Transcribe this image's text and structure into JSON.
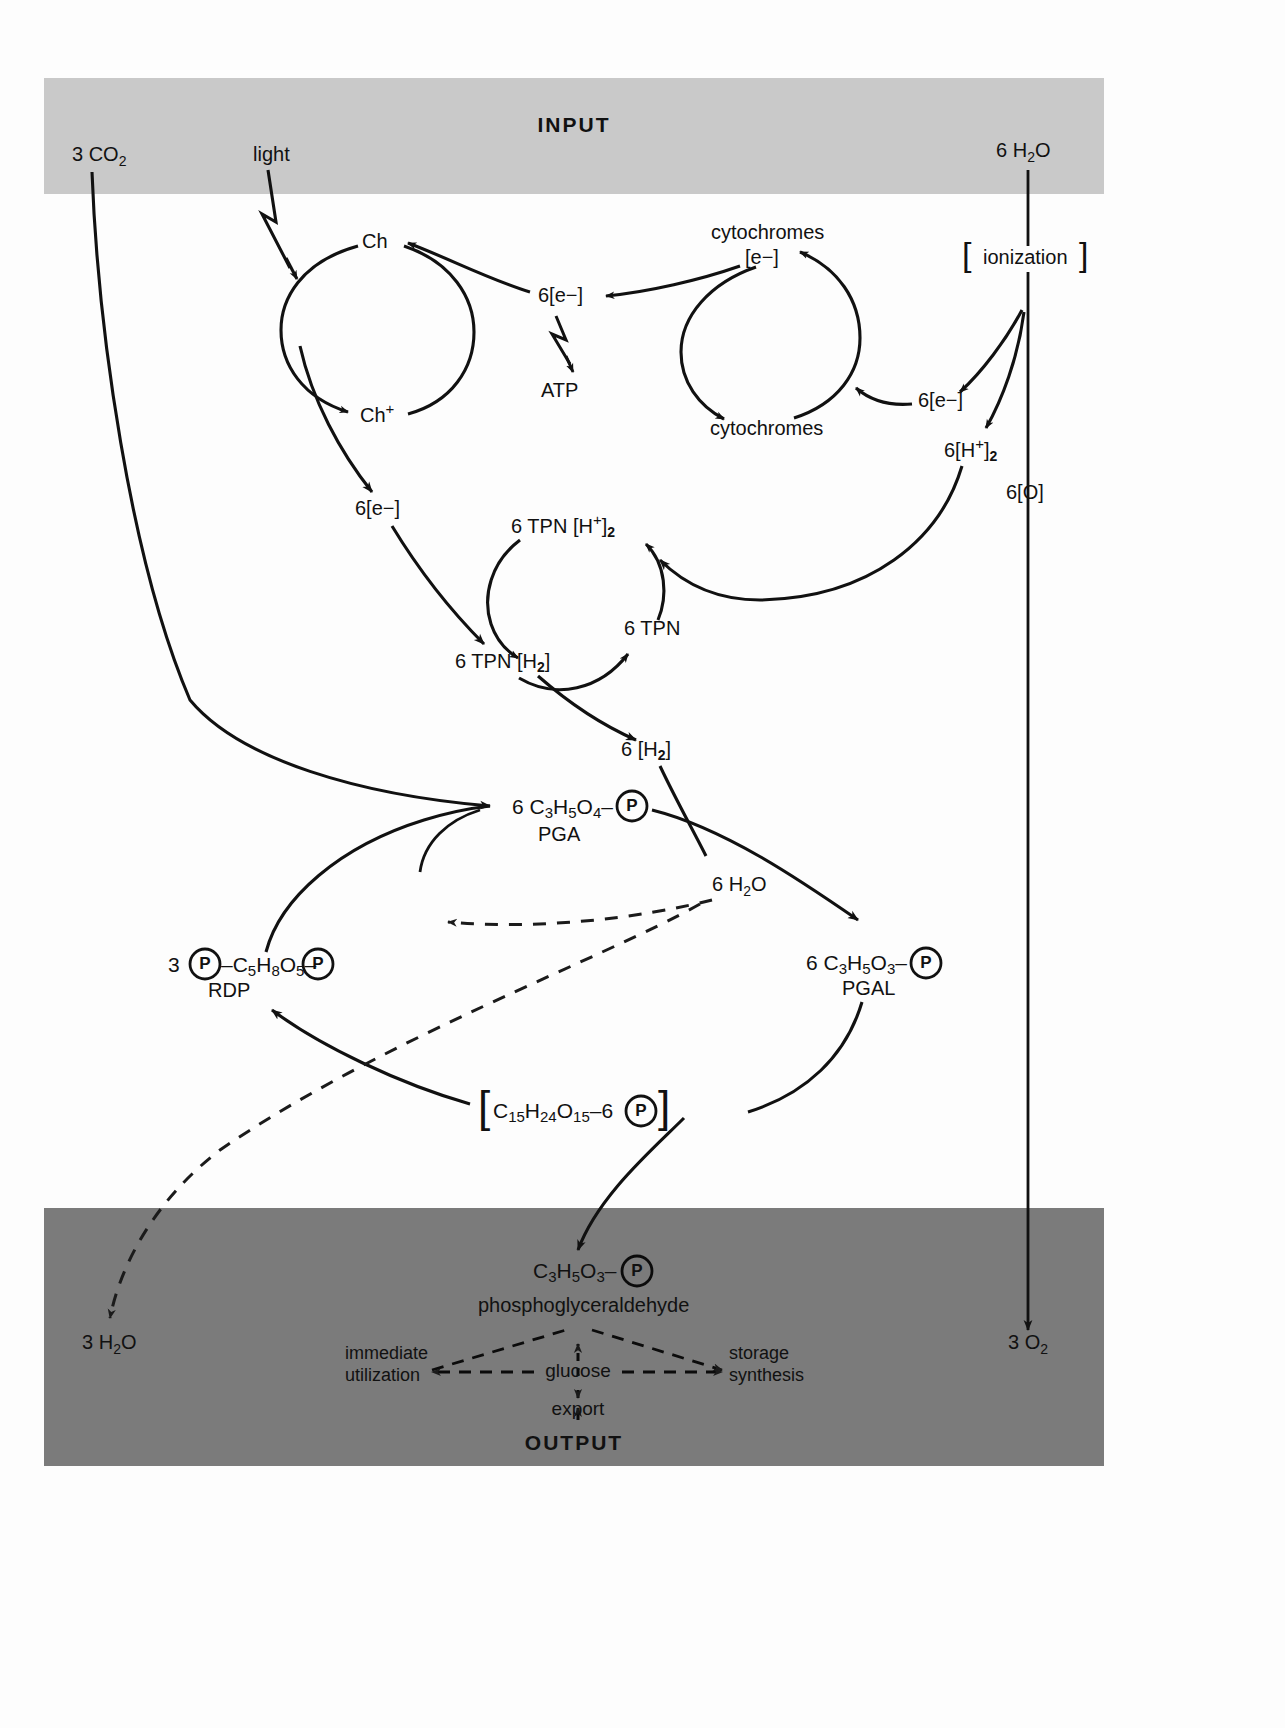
{
  "figure": {
    "input_band": {
      "title": "INPUT",
      "color": "#c9c9c9"
    },
    "output_band": {
      "title": "OUTPUT",
      "color": "#7b7b7b"
    },
    "page_background": "#fdfdfd",
    "ink": "#111111"
  },
  "inputs": {
    "co2": "3 CO",
    "co2_sub": "2",
    "light": "light",
    "water": "6 H",
    "water_sub": "2",
    "water_tail": "O"
  },
  "light_reactions": {
    "chlorophyll_reduced": "Ch",
    "chlorophyll_oxidized": "Ch",
    "chlorophyll_oxidized_sup": "+",
    "electrons_atp": "6[e−]",
    "atp": "ATP",
    "cytochromes_reduced": "cytochromes",
    "cytochromes_reduced_line2": "[e−]",
    "cytochromes_oxidized": "cytochromes",
    "electrons_from_water": "6[e−]",
    "electrons_to_tpn": "6[e−]",
    "ionization": "ionization",
    "bracket_open": "[",
    "bracket_close": "]",
    "protons": "6[H",
    "protons_sup": "+",
    "protons_mid": "]",
    "protons_sub": "2",
    "oxygen_atoms": "6[O]"
  },
  "tpn_cycle": {
    "tpn_protons": "6  TPN [H",
    "tpn_protons_sup": "+",
    "tpn_protons_mid": "]",
    "tpn_protons_sub": "2",
    "tpn": "6  TPN",
    "tpn_h2": "6  TPN [H",
    "tpn_h2_sub": "2",
    "tpn_h2_tail": "]",
    "hydrogen": "6 [H",
    "hydrogen_sub": "2",
    "hydrogen_tail": "]"
  },
  "carbon_cycle": {
    "pga_formula_a": "6 C",
    "pga_formula_a_sub": "3",
    "pga_formula_b": "H",
    "pga_formula_b_sub": "5",
    "pga_formula_c": "O",
    "pga_formula_c_sub": "4",
    "pga_dash": "–",
    "pga_name": "PGA",
    "water_byproduct": "6 H",
    "water_byproduct_sub": "2",
    "water_byproduct_tail": "O",
    "rdp_count": "3",
    "rdp_dash_left": "–",
    "rdp_formula_a": "C",
    "rdp_formula_a_sub": "5",
    "rdp_formula_b": "H",
    "rdp_formula_b_sub": "8",
    "rdp_formula_c": "O",
    "rdp_formula_c_sub": "5",
    "rdp_dash_right": "–",
    "rdp_name": "RDP",
    "pgal_formula_a": "6 C",
    "pgal_formula_a_sub": "3",
    "pgal_formula_b": "H",
    "pgal_formula_b_sub": "5",
    "pgal_formula_c": "O",
    "pgal_formula_c_sub": "3",
    "pgal_dash": "–",
    "pgal_name": "PGAL",
    "hexose_bracket_open": "[",
    "hexose_a": "C",
    "hexose_a_sub": "15",
    "hexose_b": "H",
    "hexose_b_sub": "24",
    "hexose_c": "O",
    "hexose_c_sub": "15",
    "hexose_tail": "–6",
    "hexose_bracket_close": "]",
    "phosphate_glyph": "P"
  },
  "output": {
    "pgal_formula_a": "C",
    "pgal_formula_a_sub": "3",
    "pgal_formula_b": "H",
    "pgal_formula_b_sub": "5",
    "pgal_formula_c": "O",
    "pgal_formula_c_sub": "3",
    "pgal_dash": "–",
    "pgal_name": "phosphoglyceraldehyde",
    "immediate_utilization_line1": "immediate",
    "immediate_utilization_line2": "utilization",
    "glucose": "glucose",
    "storage_synthesis_line1": "storage",
    "storage_synthesis_line2": "synthesis",
    "export": "export",
    "water_out": "3 H",
    "water_out_sub": "2",
    "water_out_tail": "O",
    "oxygen_out": "3 O",
    "oxygen_out_sub": "2"
  }
}
